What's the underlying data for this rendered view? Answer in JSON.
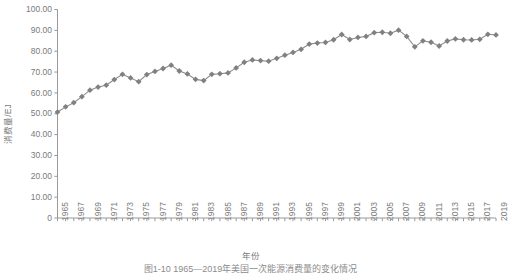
{
  "chart_data": {
    "type": "line",
    "title": "",
    "xlabel": "年份",
    "ylabel": "消费量/EJ",
    "ylim": [
      0,
      100
    ],
    "xlim": [
      1965,
      2019
    ],
    "yticks": [
      "0",
      "10.00",
      "20.00",
      "30.00",
      "40.00",
      "50.00",
      "60.00",
      "70.00",
      "80.00",
      "90.00",
      "100.00"
    ],
    "ytick_values": [
      0,
      10,
      20,
      30,
      40,
      50,
      60,
      70,
      80,
      90,
      100
    ],
    "grid": false,
    "legend": "none",
    "marker": "diamond",
    "series_color": "#808080",
    "line_color": "#8c8c8c",
    "axis_color": "#9a9a9a",
    "xtick_labels": [
      "1965",
      "1967",
      "1969",
      "1971",
      "1973",
      "1975",
      "1977",
      "1979",
      "1981",
      "1983",
      "1985",
      "1987",
      "1989",
      "1991",
      "1993",
      "1995",
      "1997",
      "1999",
      "2001",
      "2003",
      "2005",
      "2007",
      "2009",
      "2011",
      "2013",
      "2015",
      "2017",
      "2019"
    ],
    "x": [
      1965,
      1966,
      1967,
      1968,
      1969,
      1970,
      1971,
      1972,
      1973,
      1974,
      1975,
      1976,
      1977,
      1978,
      1979,
      1980,
      1981,
      1982,
      1983,
      1984,
      1985,
      1986,
      1987,
      1988,
      1989,
      1990,
      1991,
      1992,
      1993,
      1994,
      1995,
      1996,
      1997,
      1998,
      1999,
      2000,
      2001,
      2002,
      2003,
      2004,
      2005,
      2006,
      2007,
      2008,
      2009,
      2010,
      2011,
      2012,
      2013,
      2014,
      2015,
      2016,
      2017,
      2018,
      2019
    ],
    "values": [
      50.8,
      53.3,
      55.3,
      58.2,
      61.3,
      62.8,
      63.7,
      66.4,
      68.9,
      67.2,
      65.4,
      68.8,
      70.3,
      71.7,
      73.3,
      70.5,
      69.1,
      66.5,
      65.9,
      68.9,
      69.2,
      69.6,
      72.0,
      74.7,
      75.8,
      75.5,
      75.2,
      76.6,
      78.1,
      79.4,
      80.9,
      83.4,
      83.9,
      84.2,
      85.5,
      88.0,
      85.6,
      86.6,
      87.1,
      88.9,
      89.1,
      88.6,
      90.1,
      87.1,
      82.1,
      85.0,
      84.3,
      82.5,
      84.9,
      85.9,
      85.5,
      85.4,
      85.7,
      88.1,
      87.8
    ],
    "series_name": "美国一次能源消费量"
  },
  "caption": {
    "text": "图1-10  1965—2019年美国一次能源消费量的变化情况"
  }
}
